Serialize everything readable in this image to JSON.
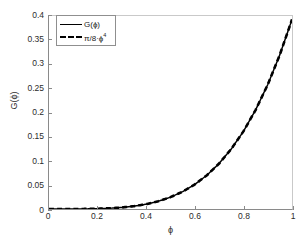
{
  "chart_data": {
    "type": "line",
    "title": "",
    "xlabel": "ϕ",
    "ylabel": "G(ϕ)",
    "xlim": [
      0,
      1
    ],
    "ylim": [
      0,
      0.4
    ],
    "xticks": [
      "0",
      "0.2",
      "0.4",
      "0.6",
      "0.8",
      "1"
    ],
    "xtick_values": [
      0,
      0.2,
      0.4,
      0.6,
      0.8,
      1
    ],
    "yticks": [
      "0",
      "0.05",
      "0.1",
      "0.15",
      "0.2",
      "0.25",
      "0.3",
      "0.35",
      "0.4"
    ],
    "ytick_values": [
      0,
      0.05,
      0.1,
      0.15,
      0.2,
      0.25,
      0.3,
      0.35,
      0.4
    ],
    "grid": false,
    "legend_position": "top-left",
    "x": [
      0,
      0.05,
      0.1,
      0.15,
      0.2,
      0.25,
      0.3,
      0.35,
      0.4,
      0.45,
      0.5,
      0.55,
      0.6,
      0.65,
      0.7,
      0.75,
      0.8,
      0.85,
      0.9,
      0.95,
      1.0
    ],
    "series": [
      {
        "name": "G(ϕ)",
        "style": "solid",
        "color": "#000000",
        "values": [
          0,
          2.5e-06,
          3.93e-05,
          0.0001988,
          0.0006283,
          0.001534,
          0.003181,
          0.005894,
          0.01005,
          0.0161,
          0.02454,
          0.03594,
          0.05089,
          0.07011,
          0.09428,
          0.1243,
          0.1608,
          0.2051,
          0.2576,
          0.3199,
          0.3927
        ]
      },
      {
        "name": "π/8·ϕ⁴",
        "style": "dashed",
        "color": "#000000",
        "values": [
          0,
          2.5e-06,
          3.93e-05,
          0.0001988,
          0.0006283,
          0.001534,
          0.003181,
          0.005894,
          0.01005,
          0.0161,
          0.02454,
          0.03594,
          0.05089,
          0.07011,
          0.09428,
          0.1243,
          0.1608,
          0.2051,
          0.2576,
          0.3199,
          0.3927
        ]
      }
    ],
    "annotations": []
  },
  "legend": {
    "entries": [
      {
        "label": "G(ϕ)",
        "base": "G(ϕ)",
        "sup": "",
        "style": "solid"
      },
      {
        "label": "π/8·ϕ⁴",
        "base": "π/8·ϕ",
        "sup": "4",
        "style": "dashed"
      }
    ]
  },
  "axes": {
    "x_title": "ϕ",
    "y_title": "G(ϕ)"
  }
}
